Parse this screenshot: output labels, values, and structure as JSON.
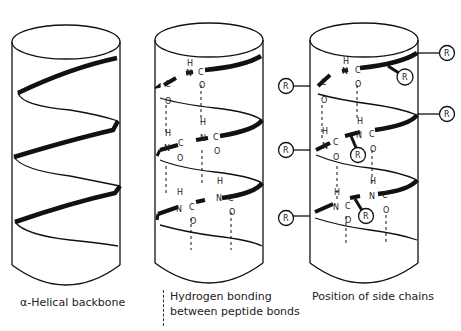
{
  "panels": [
    {
      "id": "backbone",
      "caption": "α-Helical backbone"
    },
    {
      "id": "hbonds",
      "caption_line1": "Hydrogen bonding",
      "caption_line2": "between peptide bonds",
      "legend_symbol": "dashed-line"
    },
    {
      "id": "sidechains",
      "caption": "Position of side chains"
    }
  ],
  "atoms": {
    "h": "H",
    "n": "N",
    "c": "C",
    "o": "O",
    "r": "R"
  },
  "colors": {
    "stroke": "#111111",
    "background": "#ffffff",
    "text": "#222222"
  }
}
